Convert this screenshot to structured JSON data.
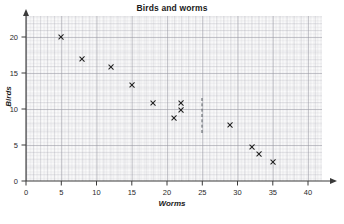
{
  "chart_data": {
    "type": "scatter",
    "title": "Birds and worms",
    "xlabel": "Worms",
    "ylabel": "Birds",
    "xlim": [
      0,
      42
    ],
    "ylim": [
      0,
      22
    ],
    "xticks": [
      0,
      5,
      10,
      15,
      20,
      25,
      30,
      35,
      40
    ],
    "yticks": [
      0,
      5,
      10,
      15,
      20
    ],
    "grid": "graph-paper",
    "legend": "none",
    "marker": "x",
    "marker_color": "#1c1c1c",
    "points": [
      {
        "x": 5,
        "y": 20.0
      },
      {
        "x": 8,
        "y": 16.9
      },
      {
        "x": 12,
        "y": 15.9
      },
      {
        "x": 15,
        "y": 13.4
      },
      {
        "x": 18,
        "y": 10.9
      },
      {
        "x": 22,
        "y": 10.8
      },
      {
        "x": 22,
        "y": 9.8
      },
      {
        "x": 21,
        "y": 8.8
      },
      {
        "x": 29,
        "y": 7.8
      },
      {
        "x": 32,
        "y": 4.7
      },
      {
        "x": 33,
        "y": 3.8
      },
      {
        "x": 35,
        "y": 2.7
      }
    ],
    "annotations": [
      {
        "type": "dashed-vertical-line",
        "x": 25,
        "y_start": 6.7,
        "y_end": 11.5,
        "color": "#555a60"
      }
    ]
  },
  "axis": {
    "x_tick_labels": [
      "0",
      "5",
      "10",
      "15",
      "20",
      "25",
      "30",
      "35",
      "40"
    ],
    "y_tick_labels": [
      "0",
      "5",
      "10",
      "15",
      "20"
    ]
  }
}
